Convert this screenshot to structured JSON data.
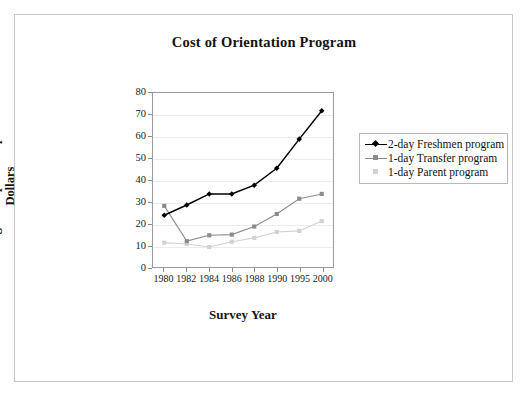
{
  "chart_data": {
    "type": "line",
    "title": "Cost of Orientation Program",
    "xlabel": "Survey Year",
    "ylabel": "Average Cost per Partipant in Dollars",
    "categories": [
      "1980",
      "1982",
      "1984",
      "1986",
      "1988",
      "1990",
      "1995",
      "2000"
    ],
    "ylim": [
      0,
      80
    ],
    "yticks": [
      0,
      10,
      20,
      30,
      40,
      50,
      60,
      70,
      80
    ],
    "grid": true,
    "legend_position": "right",
    "series": [
      {
        "name": "2-day Freshmen program",
        "color": "#000000",
        "marker": "diamond",
        "values": [
          23.8,
          28.5,
          33.6,
          33.6,
          37.6,
          45.4,
          58.8,
          71.8
        ]
      },
      {
        "name": "1-day Transfer program",
        "color": "#8c8c8c",
        "marker": "square",
        "values": [
          28.1,
          11.9,
          14.6,
          14.9,
          18.6,
          24.4,
          31.4,
          33.6
        ]
      },
      {
        "name": "1-day Parent program",
        "color": "#d2d2d2",
        "marker": "square",
        "values": [
          11.2,
          10.6,
          9.2,
          11.6,
          13.4,
          16.1,
          16.6,
          21.1
        ]
      }
    ]
  },
  "colors": {
    "freshmen": "#000000",
    "transfer": "#8c8c8c",
    "parent": "#d2d2d2",
    "axis": "#9a9a9a",
    "grid": "#ececec",
    "frame": "#c8c8c8"
  }
}
